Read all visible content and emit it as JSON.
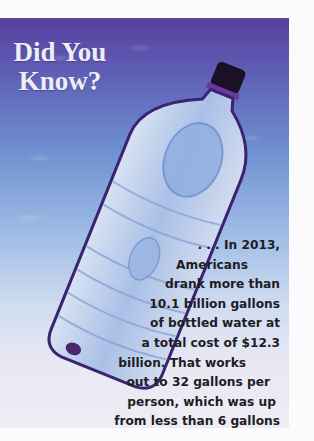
{
  "sidebar_box": {
    "title_lines": [
      "Did You",
      "Know?"
    ],
    "fact_lines": [
      ". . . In 2013,",
      "Americans",
      "drank more than",
      "10.1 billion gallons",
      "of bottled water at",
      "a total cost of $12.3",
      "billion. That works",
      "out to 32 gallons per",
      "person, which was up",
      "from less than 6 gallons",
      "in 1987."
    ],
    "image": "plastic-water-bottle-photo",
    "colors": {
      "top_background": "#5a3f9e",
      "mid_background": "#9dbbe4",
      "bottom_background": "#eeedf5",
      "title_text": "#eeeef8",
      "body_text": "#1e1c24"
    }
  }
}
